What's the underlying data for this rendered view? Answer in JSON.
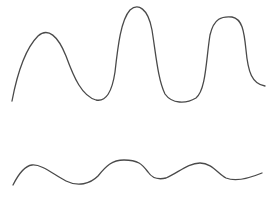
{
  "chart_data": [
    {
      "type": "line",
      "title": "",
      "xlabel": "",
      "ylabel": "",
      "grid": false,
      "legend": null,
      "series": [
        {
          "name": "upper-waveform",
          "color": "#4a4a4a",
          "points": [
            [
              12,
              101
            ],
            [
              20,
              70
            ],
            [
              30,
              45
            ],
            [
              45,
              33
            ],
            [
              58,
              42
            ],
            [
              70,
              70
            ],
            [
              82,
              92
            ],
            [
              100,
              100
            ],
            [
              112,
              85
            ],
            [
              118,
              45
            ],
            [
              125,
              15
            ],
            [
              137,
              7
            ],
            [
              148,
              15
            ],
            [
              155,
              45
            ],
            [
              160,
              80
            ],
            [
              170,
              97
            ],
            [
              190,
              100
            ],
            [
              203,
              90
            ],
            [
              208,
              55
            ],
            [
              213,
              25
            ],
            [
              222,
              18
            ],
            [
              235,
              19
            ],
            [
              244,
              30
            ],
            [
              248,
              60
            ],
            [
              252,
              78
            ],
            [
              265,
              86
            ]
          ]
        }
      ]
    },
    {
      "type": "line",
      "title": "",
      "xlabel": "",
      "ylabel": "",
      "grid": false,
      "legend": null,
      "series": [
        {
          "name": "lower-waveform",
          "color": "#4a4a4a",
          "points": [
            [
              13,
              185
            ],
            [
              22,
              172
            ],
            [
              32,
              165
            ],
            [
              45,
              170
            ],
            [
              60,
              180
            ],
            [
              80,
              185
            ],
            [
              92,
              181
            ],
            [
              105,
              166
            ],
            [
              122,
              160
            ],
            [
              138,
              163
            ],
            [
              148,
              173
            ],
            [
              155,
              179
            ],
            [
              168,
              176
            ],
            [
              185,
              166
            ],
            [
              200,
              163
            ],
            [
              210,
              167
            ],
            [
              222,
              177
            ],
            [
              232,
              180
            ],
            [
              248,
              178
            ],
            [
              262,
              173
            ]
          ]
        }
      ]
    }
  ],
  "paths": {
    "upper": "M12,101 C16,80 24,50 38,36 C48,27 58,36 66,56 C74,78 82,96 96,100 C106,102 112,92 115,72 C118,45 121,20 130,10 C138,3 148,8 152,30 C156,55 158,80 165,94 C172,104 186,104 196,98 C206,90 206,60 210,35 C214,18 222,16 232,17 C242,19 244,30 246,50 C248,72 252,84 265,86",
    "lower": "M13,185 C18,175 24,166 32,165 C42,164 54,175 66,181 C78,187 90,184 98,176 C106,166 112,160 124,160 C138,160 142,164 148,172 C152,178 158,180 166,178 C178,173 188,163 200,163 C212,163 218,174 226,178 C236,182 250,178 262,173"
  }
}
